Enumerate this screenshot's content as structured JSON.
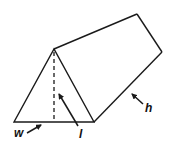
{
  "diagram": {
    "type": "triangular-prism",
    "labels": {
      "w": "w",
      "l": "l",
      "h": "h"
    },
    "colors": {
      "stroke": "#1a1a1a",
      "background": "#ffffff"
    },
    "vertices": {
      "front_left": [
        14,
        122
      ],
      "front_right": [
        94,
        122
      ],
      "front_apex": [
        54,
        49
      ],
      "back_apex": [
        137,
        14
      ],
      "back_right": [
        162,
        52
      ]
    }
  }
}
